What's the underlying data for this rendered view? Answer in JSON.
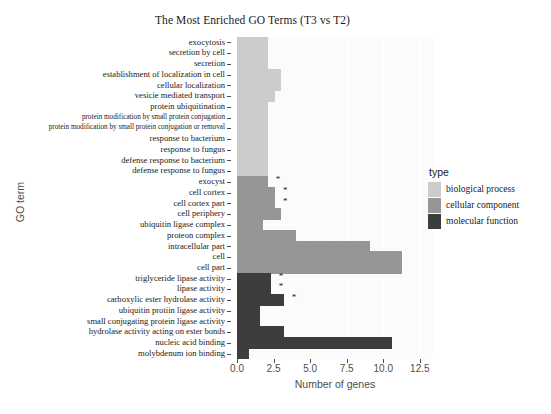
{
  "chart_data": {
    "type": "bar",
    "title": "The Most Enriched GO Terms (T3 vs T2)",
    "xlabel": "Number of genes",
    "ylabel": "GO term",
    "orientation": "horizontal",
    "xlim": [
      0,
      13.4
    ],
    "xticks": [
      0.0,
      2.5,
      5.0,
      7.5,
      10.0,
      12.5
    ],
    "xticklabels": [
      "0.0",
      "2.5",
      "5.0",
      "7.5",
      "10.0",
      "12.5"
    ],
    "grid": true,
    "legend_position": "right",
    "legend_title": "type",
    "series": [
      {
        "name": "biological process",
        "color": "#cccccc"
      },
      {
        "name": "cellular component",
        "color": "#969696"
      },
      {
        "name": "molecular function",
        "color": "#3d3d3d"
      }
    ],
    "categories": [
      "exocytosis",
      "secretion by cell",
      "secretion",
      "establishment of localization in cell",
      "cellular localization",
      "vesicie mediated transport",
      "protein ubiquitination",
      "protein modification by small protein conjugation",
      "protein modification by small protein conjugation or removal",
      "response to bacterium",
      "response to fungus",
      "defense response to bacterium",
      "defense response to fungus",
      "exocyst",
      "cell cortex",
      "cell cortex part",
      "cell periphery",
      "ubiquitin ligase complex",
      "proteon complex",
      "intracellular part",
      "cell",
      "cell part",
      "triglyceride lipase activity",
      "lipase activity",
      "carboxylic ester hydrolase activity",
      "ubiquitin protiin ligase activity",
      "small conjugating protein ligase activity",
      "hydrolase activity acting on ester bonds",
      "nucleic acid binding",
      "molybdenum ion binding"
    ],
    "points": [
      {
        "label": "exocytosis",
        "value": 2.1,
        "type": "biological process",
        "starred": false
      },
      {
        "label": "secretion by cell",
        "value": 2.1,
        "type": "biological process",
        "starred": false
      },
      {
        "label": "secretion",
        "value": 2.1,
        "type": "biological process",
        "starred": false
      },
      {
        "label": "establishment of localization in cell",
        "value": 3.0,
        "type": "biological process",
        "starred": false
      },
      {
        "label": "cellular localization",
        "value": 3.0,
        "type": "biological process",
        "starred": false
      },
      {
        "label": "vesicie mediated transport",
        "value": 2.6,
        "type": "biological process",
        "starred": false
      },
      {
        "label": "protein ubiquitination",
        "value": 2.1,
        "type": "biological process",
        "starred": false
      },
      {
        "label": "protein modification by small protein conjugation",
        "value": 2.1,
        "type": "biological process",
        "starred": false
      },
      {
        "label": "protein modification by small protein conjugation or removal",
        "value": 2.1,
        "type": "biological process",
        "starred": false
      },
      {
        "label": "response to bacterium",
        "value": 2.1,
        "type": "biological process",
        "starred": false
      },
      {
        "label": "response to fungus",
        "value": 2.1,
        "type": "biological process",
        "starred": false
      },
      {
        "label": "defense response to bacterium",
        "value": 2.1,
        "type": "biological process",
        "starred": false
      },
      {
        "label": "defense response to fungus",
        "value": 2.1,
        "type": "biological process",
        "starred": false
      },
      {
        "label": "exocyst",
        "value": 2.1,
        "type": "cellular component",
        "starred": true
      },
      {
        "label": "cell cortex",
        "value": 2.6,
        "type": "cellular component",
        "starred": true
      },
      {
        "label": "cell cortex part",
        "value": 2.6,
        "type": "cellular component",
        "starred": true
      },
      {
        "label": "cell periphery",
        "value": 3.0,
        "type": "cellular component",
        "starred": false
      },
      {
        "label": "ubiquitin ligase complex",
        "value": 1.8,
        "type": "cellular component",
        "starred": false
      },
      {
        "label": "proteon complex",
        "value": 4.0,
        "type": "cellular component",
        "starred": false
      },
      {
        "label": "intracellular part",
        "value": 9.1,
        "type": "cellular component",
        "starred": false
      },
      {
        "label": "cell",
        "value": 11.3,
        "type": "cellular component",
        "starred": false
      },
      {
        "label": "cell part",
        "value": 11.3,
        "type": "cellular component",
        "starred": false
      },
      {
        "label": "triglyceride lipase activity",
        "value": 2.3,
        "type": "molecular function",
        "starred": true
      },
      {
        "label": "lipase activity",
        "value": 2.3,
        "type": "molecular function",
        "starred": true
      },
      {
        "label": "carboxylic ester hydrolase activity",
        "value": 3.2,
        "type": "molecular function",
        "starred": true
      },
      {
        "label": "ubiquitin protiin ligase activity",
        "value": 1.6,
        "type": "molecular function",
        "starred": false
      },
      {
        "label": "small conjugating protein ligase activity",
        "value": 1.6,
        "type": "molecular function",
        "starred": false
      },
      {
        "label": "hydrolase activity acting on ester bonds",
        "value": 3.2,
        "type": "molecular function",
        "starred": false
      },
      {
        "label": "nucleic acid binding",
        "value": 10.6,
        "type": "molecular function",
        "starred": false
      },
      {
        "label": "molybdenum ion binding",
        "value": 0.8,
        "type": "molecular function",
        "starred": false
      }
    ],
    "significance_marker": "*"
  }
}
